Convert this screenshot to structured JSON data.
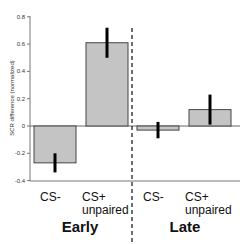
{
  "chart_data": {
    "type": "bar",
    "title": "",
    "xlabel": "",
    "ylabel": "SCR difference (normalized)",
    "ylim": [
      -0.4,
      0.8
    ],
    "yticks": [
      "0.8",
      "0.6",
      "0.4",
      "0.2",
      "0",
      "-0.2",
      "-0.4"
    ],
    "grid": false,
    "groups": [
      "Early",
      "Late"
    ],
    "categories": [
      "CS-",
      "CS+ unpaired",
      "CS-",
      "CS+ unpaired"
    ],
    "category_lines": [
      [
        "CS-"
      ],
      [
        "CS+",
        "unpaired"
      ],
      [
        "CS-"
      ],
      [
        "CS+",
        "unpaired"
      ]
    ],
    "values": [
      -0.27,
      0.61,
      -0.03,
      0.12
    ],
    "errors": [
      0.07,
      0.11,
      0.06,
      0.11
    ],
    "bar_color": "#c4c4c4",
    "annotations": [
      "dashed vertical separator between Early and Late"
    ]
  }
}
